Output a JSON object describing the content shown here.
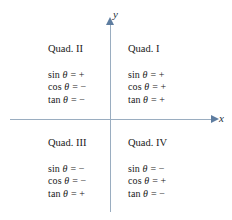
{
  "figure": {
    "type": "quadrant-sign-chart",
    "background_color": "#ffffff",
    "axis_color": "#9aadc0",
    "text_color": "#1a1a1a"
  },
  "axes": {
    "x_label": "x",
    "y_label": "y"
  },
  "quadrants": [
    {
      "id": "quadrant-1",
      "title": "Quad. I",
      "functions": [
        {
          "name": "sin",
          "variable": "θ",
          "equals": "=",
          "sign": "+"
        },
        {
          "name": "cos",
          "variable": "θ",
          "equals": "=",
          "sign": "+"
        },
        {
          "name": "tan",
          "variable": "θ",
          "equals": "=",
          "sign": "+"
        }
      ]
    },
    {
      "id": "quadrant-2",
      "title": "Quad. II",
      "functions": [
        {
          "name": "sin",
          "variable": "θ",
          "equals": "=",
          "sign": "+"
        },
        {
          "name": "cos",
          "variable": "θ",
          "equals": "=",
          "sign": "−"
        },
        {
          "name": "tan",
          "variable": "θ",
          "equals": "=",
          "sign": "−"
        }
      ]
    },
    {
      "id": "quadrant-3",
      "title": "Quad. III",
      "functions": [
        {
          "name": "sin",
          "variable": "θ",
          "equals": "=",
          "sign": "−"
        },
        {
          "name": "cos",
          "variable": "θ",
          "equals": "=",
          "sign": "−"
        },
        {
          "name": "tan",
          "variable": "θ",
          "equals": "=",
          "sign": "+"
        }
      ]
    },
    {
      "id": "quadrant-4",
      "title": "Quad. IV",
      "functions": [
        {
          "name": "sin",
          "variable": "θ",
          "equals": "=",
          "sign": "−"
        },
        {
          "name": "cos",
          "variable": "θ",
          "equals": "=",
          "sign": "+"
        },
        {
          "name": "tan",
          "variable": "θ",
          "equals": "=",
          "sign": "−"
        }
      ]
    }
  ]
}
